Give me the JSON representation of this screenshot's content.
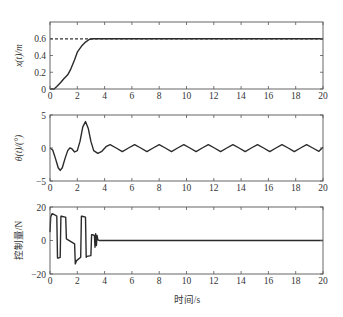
{
  "chart_data": [
    {
      "type": "line",
      "title": "",
      "xlabel": "",
      "ylabel": "x(t)/m",
      "xlim": [
        0,
        20
      ],
      "ylim": [
        0,
        0.8
      ],
      "xticks": [
        0,
        2,
        4,
        6,
        8,
        10,
        12,
        14,
        16,
        18,
        20
      ],
      "yticks": [
        0,
        0.2,
        0.4,
        0.6
      ],
      "ytick_labels": [
        "0",
        "0.2",
        "0.4",
        "0.6"
      ],
      "grid": false,
      "series": [
        {
          "name": "x(t)",
          "style": "solid",
          "x": [
            0,
            0.3,
            0.5,
            0.8,
            1.0,
            1.3,
            1.5,
            1.8,
            2.0,
            2.3,
            2.6,
            2.9,
            3.2,
            4,
            6,
            8,
            10,
            12,
            14,
            16,
            18,
            20
          ],
          "values": [
            0,
            0.0,
            0.03,
            0.08,
            0.12,
            0.17,
            0.23,
            0.35,
            0.44,
            0.51,
            0.56,
            0.595,
            0.6,
            0.6,
            0.6,
            0.6,
            0.6,
            0.6,
            0.6,
            0.6,
            0.6,
            0.6
          ]
        },
        {
          "name": "reference",
          "style": "dashed",
          "x": [
            0,
            20
          ],
          "values": [
            0.6,
            0.6
          ]
        }
      ]
    },
    {
      "type": "line",
      "title": "",
      "xlabel": "",
      "ylabel": "θ(t)/(°)",
      "xlim": [
        0,
        20
      ],
      "ylim": [
        -5,
        5
      ],
      "xticks": [
        0,
        2,
        4,
        6,
        8,
        10,
        12,
        14,
        16,
        18,
        20
      ],
      "yticks": [
        -5,
        0,
        5
      ],
      "ytick_labels": [
        "−5",
        "0",
        "5"
      ],
      "grid": false,
      "series": [
        {
          "name": "θ(t)",
          "style": "solid",
          "x": [
            0,
            0.2,
            0.4,
            0.6,
            0.75,
            0.9,
            1.1,
            1.3,
            1.45,
            1.6,
            1.8,
            2.0,
            2.2,
            2.4,
            2.6,
            2.8,
            3.0,
            3.2,
            3.5,
            3.8,
            4.1,
            4.4,
            4.85,
            5.3,
            5.75,
            6.2,
            6.65,
            7.1,
            7.55,
            8.0,
            8.45,
            8.9,
            9.35,
            9.8,
            10.25,
            10.7,
            11.15,
            11.6,
            12.05,
            12.5,
            12.95,
            13.4,
            13.85,
            14.3,
            14.75,
            15.2,
            15.65,
            16.1,
            16.55,
            17.0,
            17.45,
            17.9,
            18.35,
            18.8,
            19.25,
            19.7,
            20.0
          ],
          "values": [
            0,
            -0.3,
            -1.6,
            -3.0,
            -3.4,
            -3.0,
            -1.6,
            -0.4,
            0.0,
            -0.1,
            -0.6,
            -0.4,
            1.0,
            3.2,
            4.0,
            3.0,
            1.0,
            -0.4,
            -0.8,
            -0.5,
            0.2,
            0.5,
            0.0,
            -0.55,
            0.0,
            0.5,
            0.0,
            -0.55,
            0.0,
            0.5,
            0.0,
            -0.55,
            0.0,
            0.5,
            0.0,
            -0.55,
            0.0,
            0.5,
            0.0,
            -0.55,
            0.0,
            0.5,
            0.0,
            -0.55,
            0.0,
            0.5,
            0.0,
            -0.55,
            0.0,
            0.5,
            0.0,
            -0.55,
            0.0,
            0.5,
            0.0,
            -0.5,
            0.1
          ]
        }
      ]
    },
    {
      "type": "line",
      "title": "",
      "xlabel": "时间/s",
      "ylabel": "控制量/N",
      "xlim": [
        0,
        20
      ],
      "ylim": [
        -20,
        20
      ],
      "xticks": [
        0,
        2,
        4,
        6,
        8,
        10,
        12,
        14,
        16,
        18,
        20
      ],
      "yticks": [
        -20,
        0,
        20
      ],
      "ytick_labels": [
        "−20",
        "0",
        "20"
      ],
      "grid": false,
      "series": [
        {
          "name": "control",
          "style": "solid",
          "x": [
            0,
            0.05,
            0.15,
            0.3,
            0.5,
            0.55,
            0.6,
            0.75,
            0.8,
            0.85,
            1.1,
            1.15,
            1.2,
            1.8,
            1.85,
            1.95,
            2.25,
            2.3,
            2.35,
            2.6,
            2.65,
            2.7,
            3.0,
            3.05,
            3.1,
            3.25,
            3.3,
            3.35,
            3.4,
            3.45,
            3.5,
            3.6,
            4,
            20
          ],
          "values": [
            5,
            14,
            16,
            15.5,
            14.5,
            -10.5,
            -10.5,
            -10,
            14.5,
            14.5,
            14,
            14,
            1,
            -2,
            -14,
            -12,
            -10,
            14.5,
            14.5,
            14,
            -10,
            -9.5,
            -9,
            3.5,
            3.5,
            3,
            -4,
            4,
            -3,
            3,
            0.5,
            0,
            0,
            0
          ]
        }
      ]
    }
  ],
  "labels": {
    "plot1_ylabel": "x(t)/m",
    "plot2_ylabel": "θ(t)/(°)",
    "plot3_ylabel": "控制量/N",
    "xlabel": "时间/s"
  }
}
